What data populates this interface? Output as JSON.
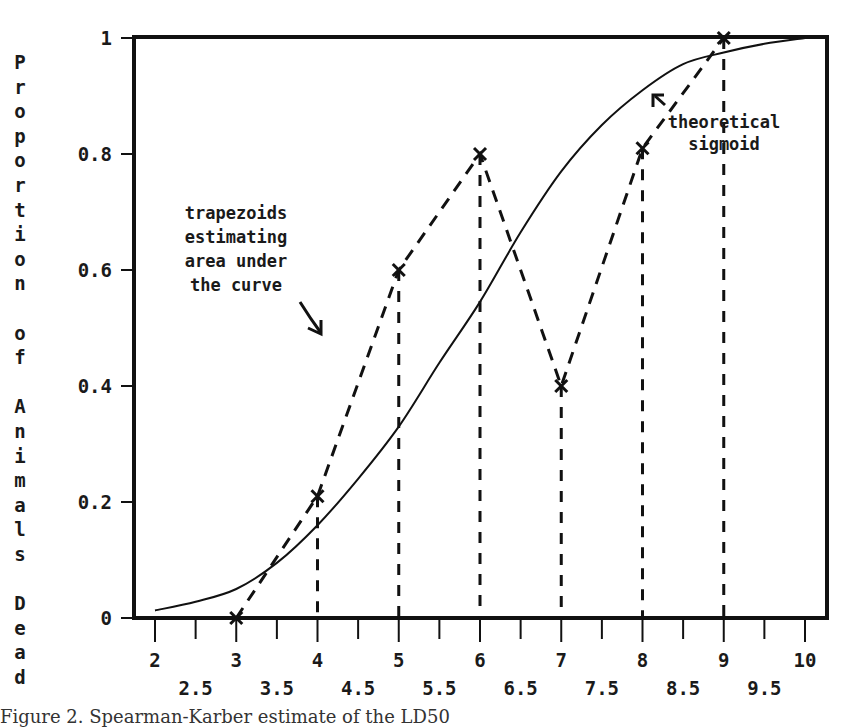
{
  "chart_data": {
    "type": "line",
    "title": "",
    "xlabel": "",
    "ylabel": "Proportion of Animals Dead",
    "xlim": [
      2,
      10
    ],
    "ylim": [
      0,
      1
    ],
    "x_ticks_major": [
      "2",
      "3",
      "4",
      "5",
      "6",
      "7",
      "8",
      "9",
      "10"
    ],
    "x_ticks_minor": [
      "2.5",
      "3.5",
      "4.5",
      "5.5",
      "6.5",
      "7.5",
      "8.5",
      "9.5"
    ],
    "y_ticks": [
      "0",
      "0.2",
      "0.4",
      "0.6",
      "0.8",
      "1"
    ],
    "grid": false,
    "legend": null,
    "series": [
      {
        "name": "observed (trapezoids)",
        "style": "dashed with x markers and dashed vertical drop lines",
        "x": [
          3,
          4,
          5,
          6,
          7,
          8,
          9
        ],
        "y": [
          0.0,
          0.21,
          0.6,
          0.8,
          0.4,
          0.81,
          1.0
        ]
      },
      {
        "name": "theoretical sigmoid",
        "style": "solid",
        "x": [
          2,
          2.5,
          3,
          3.5,
          4,
          4.5,
          5,
          5.5,
          6,
          6.5,
          7,
          7.5,
          8,
          8.5,
          9,
          9.5,
          10
        ],
        "y": [
          0.013,
          0.028,
          0.05,
          0.095,
          0.16,
          0.24,
          0.33,
          0.44,
          0.545,
          0.665,
          0.77,
          0.85,
          0.91,
          0.955,
          0.975,
          0.99,
          1.0
        ]
      }
    ],
    "annotations": [
      {
        "text": [
          "trapezoids",
          "estimating",
          "area under",
          "the curve"
        ],
        "arrow": "down-right"
      },
      {
        "text": [
          "theoretical",
          "sigmoid"
        ],
        "arrow": "up-left"
      }
    ]
  },
  "axis": {
    "y_title_letters": [
      "P",
      "r",
      "o",
      "p",
      "o",
      "r",
      "t",
      "i",
      "o",
      "n",
      " ",
      "o",
      "f",
      " ",
      "A",
      "n",
      "i",
      "m",
      "a",
      "l",
      "s",
      " ",
      "D",
      "e",
      "a",
      "d"
    ]
  },
  "caption": "Figure 2. Spearman-Karber estimate of the LD50"
}
